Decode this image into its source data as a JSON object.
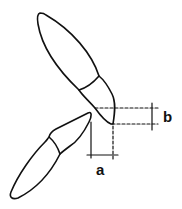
{
  "diagram": {
    "labels": {
      "a": "a",
      "b": "b"
    },
    "elements": [
      {
        "id": "upper-incisor",
        "kind": "tooth outline"
      },
      {
        "id": "lower-incisor",
        "kind": "tooth outline"
      },
      {
        "id": "dimension-a",
        "kind": "horizontal dimension",
        "label": "a"
      },
      {
        "id": "dimension-b",
        "kind": "vertical dimension",
        "label": "b"
      }
    ],
    "colors": {
      "stroke": "#111111",
      "background": "#ffffff"
    }
  }
}
